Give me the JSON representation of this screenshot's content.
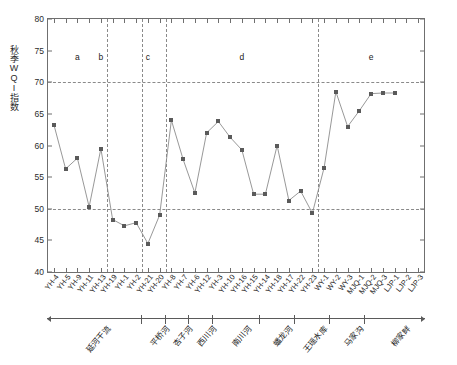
{
  "chart_data": {
    "type": "line",
    "title": "",
    "xlabel": "",
    "ylabel": "秋季WQI指数",
    "ylim": [
      40,
      80
    ],
    "yticks": [
      40,
      45,
      50,
      55,
      60,
      65,
      70,
      75,
      80
    ],
    "grid": "dashed horizontal guides at 50 and 70; dashed vertical separators between river groups",
    "legend": "none",
    "marker": "filled square",
    "categories": [
      "YH-4",
      "YH-5",
      "YH-9",
      "YH-11",
      "YH-13",
      "YH-19",
      "YH-1",
      "YH-2",
      "YH-21",
      "YH-20",
      "YH-8",
      "YH-7",
      "YH-6",
      "YH-12",
      "YH-3",
      "YH-10",
      "YH-16",
      "YH-15",
      "YH-14",
      "YH-18",
      "YH-17",
      "YH-22",
      "YH-23",
      "WY-1",
      "WY-2",
      "WY-3",
      "MJQ-1",
      "MJQ-2",
      "MJQ-3",
      "LJP-1",
      "LJP-2",
      "LJP-3"
    ],
    "values": [
      63.3,
      56.3,
      58.0,
      50.3,
      59.5,
      48.3,
      47.3,
      47.8,
      44.5,
      49.0,
      64.0,
      57.8,
      52.5,
      62.0,
      63.8,
      61.3,
      59.3,
      52.3,
      52.3,
      60.0,
      51.3,
      52.8,
      49.3,
      56.5,
      68.5,
      63.0,
      65.5,
      68.2,
      68.3,
      68.3,
      null,
      null
    ],
    "hguides": [
      50,
      70
    ],
    "region_dividers_after": [
      "YH-13",
      "YH-2",
      "YH-20",
      "YH-23"
    ],
    "region_letters": [
      {
        "label": "a",
        "center_category": "YH-9"
      },
      {
        "label": "b",
        "center_category": "YH-13"
      },
      {
        "label": "c",
        "center_category": "YH-21"
      },
      {
        "label": "d",
        "center_category": "YH-16"
      },
      {
        "label": "e",
        "center_category": "MJQ-2"
      }
    ],
    "groups": [
      {
        "label": "延河干流",
        "from": "YH-4",
        "to": "YH-2"
      },
      {
        "label": "平桥河",
        "from": "YH-21",
        "to": "YH-20"
      },
      {
        "label": "杏子河",
        "from": "YH-8",
        "to": "YH-7"
      },
      {
        "label": "西川河",
        "from": "YH-6",
        "to": "YH-12"
      },
      {
        "label": "南川河",
        "from": "YH-3",
        "to": "YH-15"
      },
      {
        "label": "蟠龙河",
        "from": "YH-14",
        "to": "YH-17"
      },
      {
        "label": "王瑶水库",
        "from": "YH-22",
        "to": "WY-1"
      },
      {
        "label": "马家沟",
        "from": "WY-2",
        "to": "MJQ-1"
      },
      {
        "label": "柳家畔",
        "from": "MJQ-2",
        "to": "LJP-3"
      }
    ],
    "colors": {
      "marker": "#5a5a5a",
      "line": "#8c8c8c",
      "axis": "#6f6f6f",
      "guide": "#8a8a8a",
      "text": "#1a1a1a"
    }
  }
}
